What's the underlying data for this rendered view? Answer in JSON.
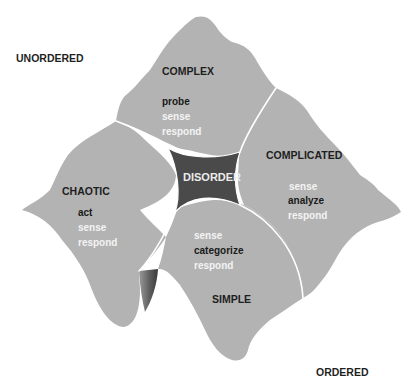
{
  "axes": {
    "unordered": "UNORDERED",
    "ordered": "ORDERED"
  },
  "center": {
    "label": "DISORDER"
  },
  "domains": {
    "complex": {
      "title": "COMPLEX",
      "verbs": [
        "probe",
        "sense",
        "respond"
      ]
    },
    "complicated": {
      "title": "COMPLICATED",
      "verbs": [
        "sense",
        "analyze",
        "respond"
      ]
    },
    "chaotic": {
      "title": "CHAOTIC",
      "verbs": [
        "act",
        "sense",
        "respond"
      ]
    },
    "simple": {
      "title": "SIMPLE",
      "verbs": [
        "sense",
        "categorize",
        "respond"
      ]
    }
  },
  "colors": {
    "region_fill": "#b3b3b3",
    "disorder_fill": "#4a4a4a",
    "divider": "#ffffff",
    "emphasis_text": "#1a1a1a",
    "secondary_text": "#f4f4f4"
  }
}
